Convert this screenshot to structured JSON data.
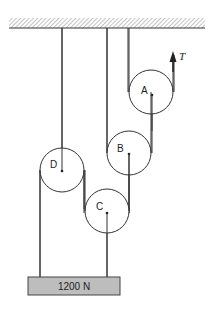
{
  "diagram": {
    "type": "pulley-system",
    "pulleys": [
      {
        "label": "A"
      },
      {
        "label": "B"
      },
      {
        "label": "C"
      },
      {
        "label": "D"
      }
    ],
    "force_label": "T",
    "load": {
      "label": "1200 N",
      "fill": "#bdbdbd"
    },
    "ceiling": {
      "hatched": true
    }
  }
}
